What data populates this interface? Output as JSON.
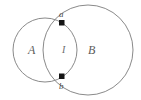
{
  "figure": {
    "kind": "venn-diagram",
    "width": 141,
    "height": 100,
    "background_color": "#ffffff",
    "stroke_color": "#8a8a8a",
    "dot_color": "#141414",
    "label_color": "#555555",
    "circles": [
      {
        "id": "circle-a",
        "label": "A",
        "center_x": 45,
        "center_y": 50,
        "radius": 32
      },
      {
        "id": "circle-b",
        "label": "B",
        "center_x": 88,
        "center_y": 50,
        "radius": 45
      }
    ],
    "intersection_points": [
      {
        "id": "point-a",
        "label": "a",
        "x": 62,
        "y": 23
      },
      {
        "id": "point-b",
        "label": "b",
        "x": 62,
        "y": 76
      }
    ],
    "lens_label": "I",
    "labels": {
      "left_region": "A",
      "right_region": "B",
      "lens_region": "I",
      "top_point": "a",
      "bottom_point": "b"
    }
  }
}
